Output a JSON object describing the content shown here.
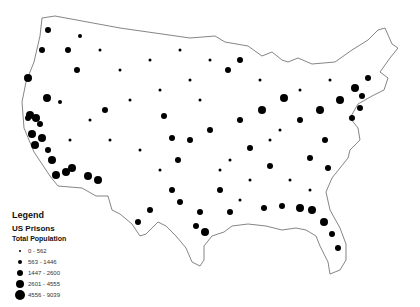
{
  "map": {
    "title": "US Prisons",
    "outline_color": "#555555",
    "dot_color": "#000000",
    "background": "#ffffff"
  },
  "legend": {
    "heading": "Legend",
    "layer": "US Prisons",
    "field": "Total Population",
    "classes": [
      {
        "label": "0 - 562",
        "size": 2
      },
      {
        "label": "563 - 1446",
        "size": 4
      },
      {
        "label": "1447 - 2600",
        "size": 6
      },
      {
        "label": "2601 - 4555",
        "size": 8
      },
      {
        "label": "4556 - 9039",
        "size": 10
      }
    ]
  }
}
